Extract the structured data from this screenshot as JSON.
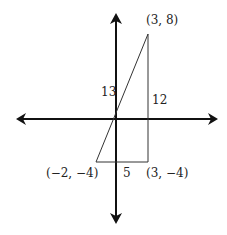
{
  "diagram": {
    "type": "coordinate-plane-right-triangle",
    "colors": {
      "axis": "#111111",
      "triangle": "#333333",
      "text": "#222222",
      "background": "#ffffff"
    },
    "axes": {
      "x_axis": "horizontal line with arrows at both ends",
      "y_axis": "vertical line with arrows at both ends"
    },
    "vertices": [
      {
        "name": "top",
        "label": "(3, 8)",
        "x": 3,
        "y": 8
      },
      {
        "name": "bottom-left",
        "label": "(−2, −4)",
        "x": -2,
        "y": -4
      },
      {
        "name": "bottom-right",
        "label": "(3, −4)",
        "x": 3,
        "y": -4
      }
    ],
    "side_labels": {
      "hypotenuse": "13",
      "vertical_leg": "12",
      "horizontal_leg": "5"
    }
  }
}
